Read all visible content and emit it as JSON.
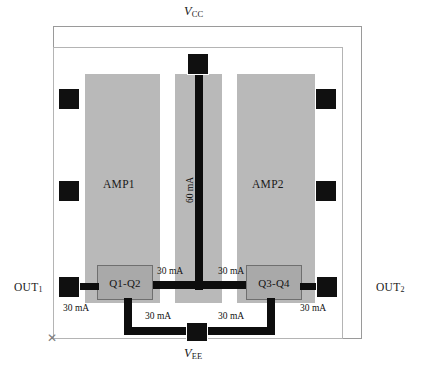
{
  "diagram": {
    "title_top": "VCC",
    "rails": {
      "vcc": {
        "symbol": "V",
        "subscript": "CC"
      },
      "vee": {
        "symbol": "V",
        "subscript": "EE"
      }
    },
    "outputs": [
      {
        "name": "out1",
        "label": "OUT",
        "subscript": "1"
      },
      {
        "name": "out2",
        "label": "OUT",
        "subscript": "2"
      }
    ],
    "amplifiers": [
      {
        "name": "amp1",
        "label": "AMP1"
      },
      {
        "name": "amp2",
        "label": "AMP2"
      }
    ],
    "transistor_blocks": [
      {
        "name": "q1-q2",
        "label": "Q1-Q2"
      },
      {
        "name": "q3-q4",
        "label": "Q3-Q4"
      }
    ],
    "currents": {
      "supply_trunk": "60 mA",
      "left_collector": "30 mA",
      "right_collector": "30 mA",
      "left_output": "30 mA",
      "right_output": "30 mA",
      "left_emitter": "30 mA",
      "right_emitter": "30 mA"
    },
    "corner_marker": "✕",
    "colors": {
      "die_fill": "#b9b9b9",
      "metal": "#0d0d0d",
      "block_fill": "#a9a9a9",
      "frame": "#9a9a9a",
      "background": "#ffffff"
    }
  }
}
